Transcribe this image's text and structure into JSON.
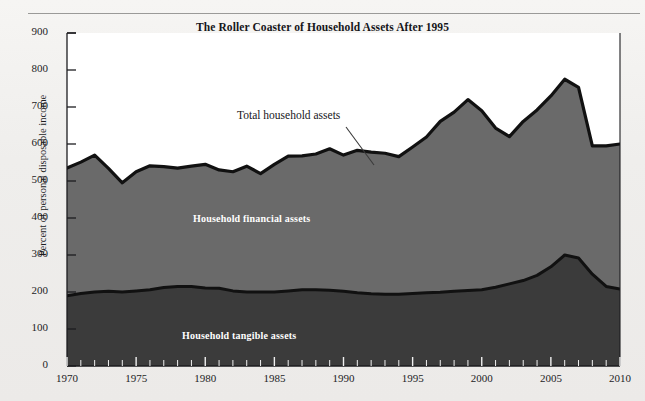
{
  "chart_data": {
    "type": "area",
    "title": "The Roller Coaster of Household Assets After 1995",
    "xlabel": "",
    "ylabel": "Percent of personal disposable income",
    "xlim": [
      1970,
      2010
    ],
    "ylim": [
      0,
      900
    ],
    "ytick_step": 100,
    "yticks": [
      0,
      100,
      200,
      300,
      400,
      500,
      600,
      700,
      800,
      900
    ],
    "xticks_labeled": [
      1970,
      1975,
      1980,
      1985,
      1990,
      1995,
      2000,
      2005,
      2010
    ],
    "xtick_minor_step": 1,
    "grid": false,
    "legend": "in-plot annotations",
    "stacked": true,
    "annotations": [
      {
        "text": "Total household assets",
        "kind": "leader-label",
        "points_to_year": 1992
      },
      {
        "text": "Household financial assets",
        "kind": "band-label"
      },
      {
        "text": "Household tangible assets",
        "kind": "band-label"
      }
    ],
    "x": [
      1970,
      1971,
      1972,
      1973,
      1974,
      1975,
      1976,
      1977,
      1978,
      1979,
      1980,
      1981,
      1982,
      1983,
      1984,
      1985,
      1986,
      1987,
      1988,
      1989,
      1990,
      1991,
      1992,
      1993,
      1994,
      1995,
      1996,
      1997,
      1998,
      1999,
      2000,
      2001,
      2002,
      2003,
      2004,
      2005,
      2006,
      2007,
      2008,
      2009,
      2010
    ],
    "series": [
      {
        "name": "Household tangible assets",
        "color": "#3b3b3b",
        "values": [
          190,
          196,
          200,
          202,
          200,
          203,
          206,
          212,
          215,
          215,
          211,
          210,
          203,
          200,
          200,
          200,
          203,
          206,
          206,
          205,
          202,
          198,
          195,
          194,
          194,
          196,
          198,
          199,
          202,
          204,
          206,
          213,
          222,
          231,
          245,
          268,
          300,
          292,
          248,
          215,
          208
        ]
      },
      {
        "name": "Household financial assets",
        "color": "#6a6a6a",
        "values": [
          345,
          355,
          370,
          332,
          295,
          322,
          335,
          327,
          320,
          325,
          334,
          320,
          322,
          340,
          320,
          345,
          364,
          362,
          367,
          382,
          368,
          385,
          383,
          381,
          372,
          396,
          421,
          462,
          484,
          516,
          484,
          430,
          398,
          430,
          447,
          462,
          475,
          461,
          347,
          380,
          392
        ]
      }
    ],
    "total": {
      "name": "Total household assets",
      "values": [
        535,
        551,
        570,
        534,
        495,
        525,
        541,
        539,
        535,
        540,
        545,
        530,
        525,
        540,
        520,
        545,
        567,
        568,
        573,
        587,
        570,
        583,
        578,
        575,
        566,
        592,
        619,
        661,
        686,
        720,
        690,
        643,
        620,
        661,
        692,
        730,
        775,
        753,
        595,
        595,
        600
      ]
    }
  },
  "annotations": {
    "total_label": "Total household assets",
    "financial_label": "Household financial assets",
    "tangible_label": "Household tangible assets"
  },
  "axes": {
    "y_title": "Percent of personal disposable income",
    "y_labels": [
      "900",
      "800",
      "700",
      "600",
      "500",
      "400",
      "300",
      "200",
      "100",
      "0"
    ],
    "x_labels": [
      "1970",
      "1975",
      "1980",
      "1985",
      "1990",
      "1995",
      "2000",
      "2005",
      "2010"
    ]
  },
  "colors": {
    "tangible": "#3b3b3b",
    "financial": "#6a6a6a",
    "outline": "#111111",
    "background": "#efeeec",
    "axis": "#1d1d1f",
    "label_text": "#ffffff"
  }
}
